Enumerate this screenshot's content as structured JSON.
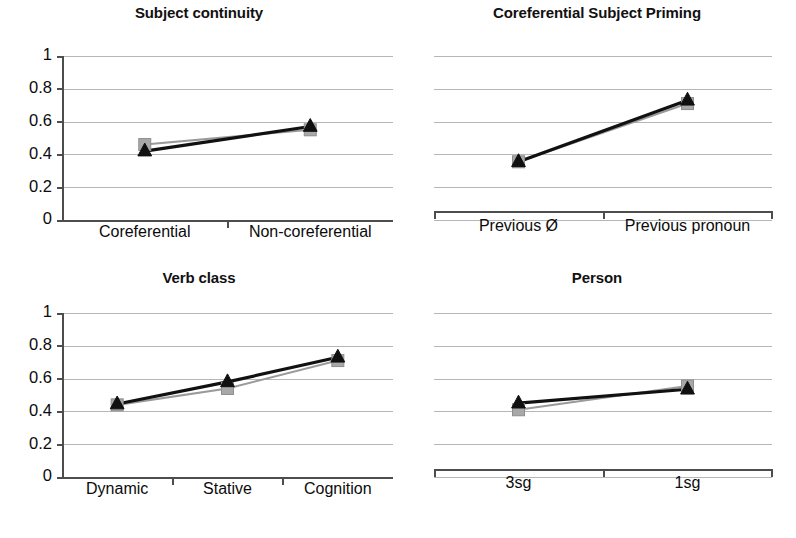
{
  "figure": {
    "background_color": "#ffffff",
    "layout": "2x2 grid of line charts",
    "series_colors": {
      "gray_series": "#a8a8a8",
      "black_series": "#101010"
    }
  },
  "chart_data": [
    {
      "type": "line",
      "title": "Subject continuity",
      "panel_position": "top-left",
      "categories": [
        "Coreferential",
        "Non-coreferential"
      ],
      "series": [
        {
          "name": "gray-square-series",
          "marker": "square",
          "color": "#a8a8a8",
          "values": [
            0.46,
            0.55
          ]
        },
        {
          "name": "black-triangle-series",
          "marker": "triangle",
          "color": "#101010",
          "values": [
            0.42,
            0.57
          ]
        }
      ],
      "xlabel": "",
      "ylabel": "",
      "ylim": [
        0,
        1
      ],
      "yticks": [
        "0",
        "0.2",
        "0.4",
        "0.6",
        "0.8",
        "1"
      ],
      "ytick_values": [
        0,
        0.2,
        0.4,
        0.6,
        0.8,
        1
      ],
      "show_y_axis": true,
      "grid": true,
      "legend": "none"
    },
    {
      "type": "line",
      "title": "Coreferential Subject Priming",
      "panel_position": "top-right",
      "categories": [
        "Previous Ø",
        "Previous pronoun"
      ],
      "series": [
        {
          "name": "gray-square-series",
          "marker": "square",
          "color": "#a8a8a8",
          "values": [
            0.355,
            0.71
          ]
        },
        {
          "name": "black-triangle-series",
          "marker": "triangle",
          "color": "#101010",
          "values": [
            0.355,
            0.73
          ]
        }
      ],
      "xlabel": "",
      "ylabel": "",
      "ylim": [
        0,
        1
      ],
      "yticks": [],
      "ytick_values": [
        0,
        0.2,
        0.4,
        0.6,
        0.8,
        1
      ],
      "show_y_axis": false,
      "grid": true,
      "legend": "none"
    },
    {
      "type": "line",
      "title": "Verb class",
      "panel_position": "bottom-left",
      "categories": [
        "Dynamic",
        "Stative",
        "Cognition"
      ],
      "series": [
        {
          "name": "gray-square-series",
          "marker": "square",
          "color": "#a8a8a8",
          "values": [
            0.44,
            0.54,
            0.71
          ]
        },
        {
          "name": "black-triangle-series",
          "marker": "triangle",
          "color": "#101010",
          "values": [
            0.445,
            0.58,
            0.73
          ]
        }
      ],
      "xlabel": "",
      "ylabel": "",
      "ylim": [
        0,
        1
      ],
      "yticks": [
        "0",
        "0.2",
        "0.4",
        "0.6",
        "0.8",
        "1"
      ],
      "ytick_values": [
        0,
        0.2,
        0.4,
        0.6,
        0.8,
        1
      ],
      "show_y_axis": true,
      "grid": true,
      "legend": "none"
    },
    {
      "type": "line",
      "title": "Person",
      "panel_position": "bottom-right",
      "categories": [
        "3sg",
        "1sg"
      ],
      "series": [
        {
          "name": "gray-square-series",
          "marker": "square",
          "color": "#a8a8a8",
          "values": [
            0.41,
            0.555
          ]
        },
        {
          "name": "black-triangle-series",
          "marker": "triangle",
          "color": "#101010",
          "values": [
            0.45,
            0.535
          ]
        }
      ],
      "xlabel": "",
      "ylabel": "",
      "ylim": [
        0,
        1
      ],
      "yticks": [],
      "ytick_values": [
        0,
        0.2,
        0.4,
        0.6,
        0.8,
        1
      ],
      "show_y_axis": false,
      "grid": true,
      "legend": "none"
    }
  ]
}
